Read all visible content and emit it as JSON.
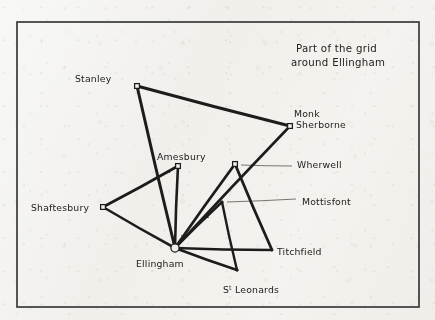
{
  "figure": {
    "kind": "hand-drawn-network-sketch",
    "title_lines": [
      "Part of the grid",
      "around  Ellingham"
    ],
    "border_color": "#3a3a3a",
    "ink_color": "#1e1c1b",
    "paper_color": "#f1f0ec"
  },
  "chart_data": {
    "type": "scatter",
    "title": "Part of the grid around Ellingham",
    "xlabel": "",
    "ylabel": "",
    "nodes": [
      {
        "id": "stanley",
        "label": "Stanley",
        "x": 137,
        "y": 86,
        "marker": "square-open",
        "label_dx": -62,
        "label_dy": -4,
        "anchor": "start"
      },
      {
        "id": "monk_sherborne",
        "label": "Monk Sherborne",
        "label_line_1": "Monk",
        "label_line_2": "Sherborne",
        "x": 290,
        "y": 126,
        "marker": "square-open",
        "label_dx": 4,
        "label_dy": -9,
        "anchor": "start"
      },
      {
        "id": "amesbury",
        "label": "Amesbury",
        "x": 178,
        "y": 166,
        "marker": "square-open",
        "label_dx": -21,
        "label_dy": -6,
        "anchor": "start"
      },
      {
        "id": "wherwell",
        "label": "Wherwell",
        "x": 235,
        "y": 164,
        "marker": "square-open",
        "label_dx": 62,
        "label_dy": 4,
        "anchor": "start",
        "leader": true
      },
      {
        "id": "mottisfont",
        "label": "Mottisfont",
        "x": 222,
        "y": 202,
        "marker": "dot",
        "label_dx": 80,
        "label_dy": 3,
        "anchor": "start",
        "leader": true
      },
      {
        "id": "shaftesbury",
        "label": "Shaftesbury",
        "x": 103,
        "y": 207,
        "marker": "square-open",
        "label_dx": -72,
        "label_dy": 4,
        "anchor": "start"
      },
      {
        "id": "ellingham",
        "label": "Ellingham",
        "x": 175,
        "y": 248,
        "marker": "circle-open",
        "label_dx": -39,
        "label_dy": 19,
        "anchor": "start"
      },
      {
        "id": "st_leonards",
        "label": "St Leonards",
        "label_main": "S",
        "label_sup": "t",
        "label_rest": "Leonards",
        "x": 237,
        "y": 270,
        "marker": "dot",
        "label_dx": -14,
        "label_dy": 23,
        "anchor": "start"
      },
      {
        "id": "titchfield",
        "label": "Titchfield",
        "x": 272,
        "y": 250,
        "marker": "none",
        "label_dx": 5,
        "label_dy": 5,
        "anchor": "start"
      }
    ],
    "edges": [
      {
        "from": "stanley",
        "to": "monk_sherborne",
        "width": 3.0
      },
      {
        "from": "stanley",
        "to": "ellingham",
        "width": 3.0
      },
      {
        "from": "monk_sherborne",
        "to": "ellingham",
        "width": 2.6
      },
      {
        "from": "shaftesbury",
        "to": "amesbury",
        "width": 2.8
      },
      {
        "from": "shaftesbury",
        "to": "ellingham",
        "width": 2.6
      },
      {
        "from": "amesbury",
        "to": "ellingham",
        "width": 2.6
      },
      {
        "from": "wherwell",
        "to": "ellingham",
        "width": 2.8
      },
      {
        "from": "wherwell",
        "to": "titchfield",
        "width": 2.8
      },
      {
        "from": "mottisfont",
        "to": "ellingham",
        "width": 2.4
      },
      {
        "from": "mottisfont",
        "to": "st_leonards",
        "width": 2.4
      },
      {
        "from": "ellingham",
        "to": "st_leonards",
        "width": 2.6
      },
      {
        "from": "ellingham",
        "to": "titchfield",
        "width": 2.6
      }
    ],
    "leader_lines": [
      {
        "for": "wherwell",
        "from_x": 241,
        "from_y": 165,
        "to_x": 292,
        "to_y": 166
      },
      {
        "for": "mottisfont",
        "from_x": 227,
        "from_y": 202,
        "to_x": 296,
        "to_y": 199
      }
    ],
    "border": {
      "x": 17,
      "y": 22,
      "width": 402,
      "height": 285
    }
  }
}
